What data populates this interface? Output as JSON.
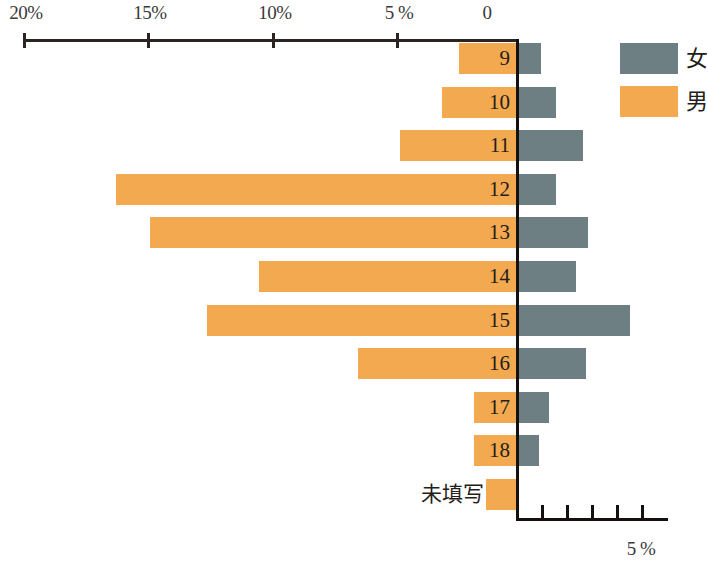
{
  "chart_data": {
    "type": "bar",
    "orientation": "horizontal",
    "layout": "diverging-population-pyramid",
    "title": "",
    "xlabel": "",
    "ylabel": "",
    "categories": [
      "9",
      "10",
      "11",
      "12",
      "13",
      "14",
      "15",
      "16",
      "17",
      "18",
      "未填写"
    ],
    "series": [
      {
        "name": "男",
        "color": "#f3a950",
        "side": "left",
        "unit": "%",
        "values": [
          2.3,
          3.0,
          4.7,
          16.2,
          14.8,
          10.4,
          12.5,
          6.4,
          1.7,
          1.7,
          1.2
        ]
      },
      {
        "name": "女",
        "color": "#6e7f83",
        "side": "right",
        "unit": "%",
        "values": [
          0.9,
          1.5,
          2.6,
          1.5,
          2.8,
          2.3,
          4.5,
          2.7,
          1.2,
          0.8,
          0.0
        ]
      }
    ],
    "left_axis": {
      "tick_values": [
        20,
        15,
        10,
        5,
        0
      ],
      "tick_labels": [
        "20%",
        "15%",
        "10%",
        "5 %",
        "0"
      ],
      "max": 20,
      "min": 0
    },
    "right_axis": {
      "tick_values": [
        0,
        1,
        2,
        3,
        4,
        5
      ],
      "tick_labels": [
        "",
        "",
        "",
        "",
        "",
        "5 %"
      ],
      "max": 5,
      "min": 0,
      "label": "5 %"
    },
    "grid": false,
    "legend_position": "top-right",
    "legend": [
      {
        "label": "女",
        "color": "#6e7f83"
      },
      {
        "label": "男",
        "color": "#f3a950"
      }
    ]
  },
  "axis_top": {
    "labels": [
      "20%",
      "15%",
      "10%",
      "5 %",
      "0"
    ]
  },
  "axis_bottom": {
    "label": "5 %"
  },
  "rows": [
    {
      "label": "9"
    },
    {
      "label": "10"
    },
    {
      "label": "11"
    },
    {
      "label": "12"
    },
    {
      "label": "13"
    },
    {
      "label": "14"
    },
    {
      "label": "15"
    },
    {
      "label": "16"
    },
    {
      "label": "17"
    },
    {
      "label": "18"
    },
    {
      "label": "未填写"
    }
  ],
  "legend": {
    "female_label": "女",
    "male_label": "男"
  }
}
